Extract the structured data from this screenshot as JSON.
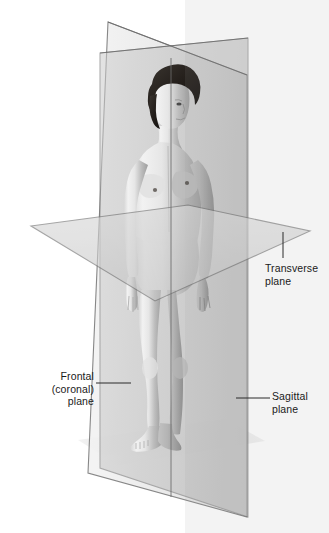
{
  "illustration": {
    "title": "Anatomical planes of the human body",
    "subject": "standing female figure",
    "labels": {
      "frontal": "Frontal\n(coronal)\nplane",
      "transverse": "Transverse\nplane",
      "sagittal": "Sagittal\nplane"
    },
    "planes": [
      {
        "id": "frontal-coronal-plane",
        "name": "Frontal (coronal) plane",
        "orientation": "vertical, divides body into anterior and posterior"
      },
      {
        "id": "sagittal-plane",
        "name": "Sagittal plane",
        "orientation": "vertical, divides body into left and right"
      },
      {
        "id": "transverse-plane",
        "name": "Transverse plane",
        "orientation": "horizontal, divides body into superior and inferior"
      }
    ],
    "colors": {
      "background": "#ffffff",
      "frontal_plane_fill": "#e9e9e9",
      "sagittal_plane_fill": "#b9b9b9",
      "transverse_plane_fill": "#cfcfcf",
      "plane_edge": "#6b6b6b",
      "floor_shadow": "#e2e2e2",
      "leader_line": "#2b2b2b",
      "label_text": "#1a1a1a",
      "skin_light": "#efefef",
      "skin_mid": "#c9c9c9",
      "skin_shadow": "#9a9a9a",
      "hair_dark": "#2a2622"
    }
  }
}
